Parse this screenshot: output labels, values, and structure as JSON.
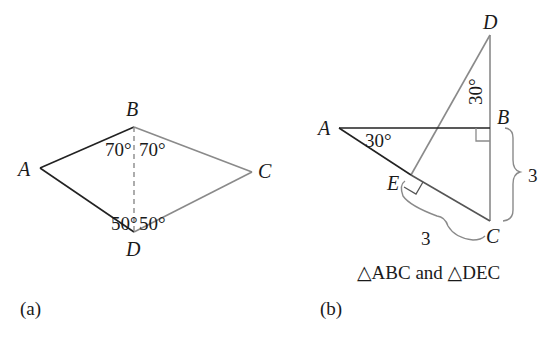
{
  "figure_a": {
    "caption": "(a)",
    "vertices": {
      "A": "A",
      "B": "B",
      "C": "C",
      "D": "D"
    },
    "angles": {
      "ABD": "70°",
      "CBD": "70°",
      "ADB": "50°",
      "CDB": "50°"
    },
    "colors": {
      "triangle_ABD": "#222222",
      "triangle_CBD": "#8a8a8a",
      "segment_BD": "#8a8a8a"
    }
  },
  "figure_b": {
    "caption": "(b)",
    "subtitle": "△ABC and △DEC",
    "vertices": {
      "A": "A",
      "B": "B",
      "C": "C",
      "D": "D",
      "E": "E"
    },
    "angles": {
      "BAC": "30°",
      "BDE": "30°"
    },
    "lengths": {
      "EC": "3",
      "BC": "3"
    },
    "colors": {
      "triangle_ABC": "#222222",
      "triangle_DEC": "#8a8a8a"
    }
  }
}
